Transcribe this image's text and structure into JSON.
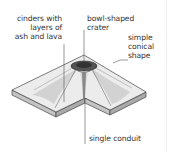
{
  "diagram": {
    "labels": {
      "cinders": [
        "cinders with",
        "layers of",
        "ash and lava"
      ],
      "crater": [
        "bowl-shaped",
        "crater"
      ],
      "shape": [
        "simple",
        "conical",
        "shape"
      ],
      "conduit": "single conduit"
    },
    "colors": {
      "top_surface": "#ececec",
      "side_face": "#bdbdbd",
      "crater_dark": "#444444",
      "leader_line": "#555555",
      "text": "#333333"
    }
  }
}
